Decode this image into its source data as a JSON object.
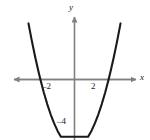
{
  "figure": {
    "background_color": "#ffffff",
    "curve_color": "#1a1a1a",
    "axis_color": "#808080",
    "label_color": "#1a1a1a"
  },
  "labels": {
    "y_axis": "y",
    "x_axis": "x",
    "tick_neg2": "–2",
    "tick_pos2": "2",
    "tick_neg4": "–4"
  },
  "chart_data": {
    "type": "line",
    "title": "",
    "xlabel": "x",
    "ylabel": "y",
    "equation": "y = x^2 - 4",
    "vertex": [
      0,
      -4
    ],
    "x_intercepts": [
      -2,
      2
    ],
    "y_intercept": -4,
    "xlim": [
      -3.8,
      3.9
    ],
    "ylim": [
      -4.9,
      5.8
    ],
    "grid": false,
    "legend": null,
    "xticks": [
      -2,
      2
    ],
    "xticklabels": [
      "–2",
      "2"
    ],
    "yticks": [
      -4
    ],
    "yticklabels": [
      "–4"
    ],
    "series": [
      {
        "name": "y = x^2 - 4",
        "x": [
          -3.1,
          -2.9,
          -2.7,
          -2.5,
          -2.3,
          -2.1,
          -2.0,
          -1.8,
          -1.6,
          -1.4,
          -1.2,
          -1.0,
          -0.8,
          -0.6,
          -0.4,
          -0.2,
          0.0,
          0.2,
          0.4,
          0.6,
          0.8,
          1.0,
          1.2,
          1.4,
          1.6,
          1.8,
          2.0,
          2.1,
          2.3,
          2.5,
          2.7,
          2.9,
          3.1
        ],
        "y": [
          5.61,
          4.41,
          3.29,
          2.25,
          1.29,
          0.41,
          0.0,
          -0.76,
          -1.44,
          -2.04,
          -2.56,
          -3.0,
          -3.36,
          -3.64,
          -3.84,
          -3.96,
          -4.0,
          -3.96,
          -3.84,
          -3.64,
          -3.36,
          -3.0,
          -2.56,
          -2.04,
          -1.44,
          -0.76,
          0.0,
          0.41,
          1.29,
          2.25,
          3.29,
          4.41,
          5.61
        ]
      }
    ],
    "axes": {
      "x_axis_arrows": "both",
      "y_axis_arrows": "up"
    }
  }
}
